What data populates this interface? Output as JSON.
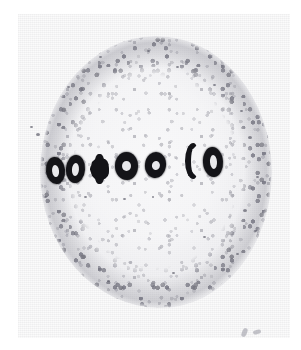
{
  "image": {
    "kind": "light-micrograph",
    "subject": "cell-in-metaphase",
    "alt_text": "Black and white light micrograph of a rounded cell with granular cytoplasm; seven darkly stained chromosomes are aligned in a single row across the equator of the cell.",
    "caption": "",
    "tone": "grayscale"
  },
  "colors": {
    "paper": "#ffffff",
    "plate_background": "#fbfbfb",
    "cytoplasm": "#f4f4f6",
    "granule": "#96969e",
    "cell_rim": "#6e6e78",
    "chromosome_stain": "#141418",
    "chromosome_lumen": "#e9e9ec"
  },
  "cell": {
    "label": "cell",
    "shape": "round",
    "center_x": 138,
    "center_y": 172,
    "width": 232,
    "height": 272,
    "texture": "granular"
  },
  "metaphase_plate": {
    "label": "metaphase-plate",
    "row_center_y": 170,
    "chromosome_count": 7,
    "chromosomes": [
      {
        "id": 1,
        "label": "chromosome-1",
        "shape": "ring",
        "x": 46,
        "y": 157,
        "w": 19,
        "h": 27,
        "lumen_w": 7,
        "lumen_h": 12,
        "rotation": -6
      },
      {
        "id": 2,
        "label": "chromosome-2",
        "shape": "ring",
        "x": 66,
        "y": 155,
        "w": 19,
        "h": 28,
        "lumen_w": 7,
        "lumen_h": 13,
        "rotation": 4
      },
      {
        "id": 3,
        "label": "chromosome-3",
        "shape": "cross",
        "x": 90,
        "y": 154,
        "w": 19,
        "h": 30,
        "lumen_w": 0,
        "lumen_h": 0,
        "rotation": 0
      },
      {
        "id": 4,
        "label": "chromosome-4",
        "shape": "ring",
        "x": 115,
        "y": 152,
        "w": 23,
        "h": 28,
        "lumen_w": 9,
        "lumen_h": 10,
        "rotation": 0
      },
      {
        "id": 5,
        "label": "chromosome-5",
        "shape": "ring",
        "x": 145,
        "y": 152,
        "w": 21,
        "h": 26,
        "lumen_w": 8,
        "lumen_h": 9,
        "rotation": 8
      },
      {
        "id": 6,
        "label": "chromosome-6",
        "shape": "hook",
        "x": 185,
        "y": 143,
        "w": 14,
        "h": 36,
        "lumen_w": 0,
        "lumen_h": 0,
        "rotation": 0
      },
      {
        "id": 7,
        "label": "chromosome-7",
        "shape": "ring",
        "x": 203,
        "y": 147,
        "w": 20,
        "h": 30,
        "lumen_w": 7,
        "lumen_h": 14,
        "rotation": -4
      }
    ]
  },
  "specks": [
    {
      "x": 36,
      "y": 133,
      "size": 4
    },
    {
      "x": 30,
      "y": 126,
      "size": 3
    },
    {
      "x": 44,
      "y": 196,
      "size": 3
    },
    {
      "x": 84,
      "y": 196,
      "size": 3
    },
    {
      "x": 123,
      "y": 198,
      "size": 3
    },
    {
      "x": 152,
      "y": 196,
      "size": 2
    },
    {
      "x": 213,
      "y": 84,
      "size": 3
    },
    {
      "x": 240,
      "y": 110,
      "size": 3
    },
    {
      "x": 248,
      "y": 136,
      "size": 4
    },
    {
      "x": 256,
      "y": 176,
      "size": 3
    },
    {
      "x": 243,
      "y": 209,
      "size": 4
    },
    {
      "x": 254,
      "y": 230,
      "size": 3
    },
    {
      "x": 236,
      "y": 253,
      "size": 3
    },
    {
      "x": 99,
      "y": 56,
      "size": 3
    },
    {
      "x": 147,
      "y": 50,
      "size": 3
    },
    {
      "x": 176,
      "y": 66,
      "size": 3
    },
    {
      "x": 67,
      "y": 86,
      "size": 3
    },
    {
      "x": 203,
      "y": 236,
      "size": 3
    },
    {
      "x": 172,
      "y": 272,
      "size": 3
    },
    {
      "x": 107,
      "y": 280,
      "size": 3
    }
  ],
  "corner_marks": {
    "label": "faint-corner-marks",
    "x": 222,
    "y": 312,
    "description": "two small faint grey marks near the lower-right of the plate"
  }
}
